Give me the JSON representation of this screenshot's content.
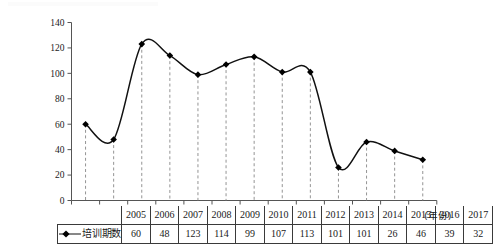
{
  "chart_data": {
    "type": "line",
    "title": "",
    "xlabel": "(年份)",
    "ylabel": "",
    "categories": [
      "2005",
      "2006",
      "2007",
      "2008",
      "2009",
      "2010",
      "2011",
      "2012",
      "2013",
      "2014",
      "2015",
      "2016",
      "2017"
    ],
    "series": [
      {
        "name": "培训期数",
        "values": [
          60,
          48,
          123,
          114,
          99,
          107,
          113,
          101,
          101,
          26,
          46,
          39,
          32
        ]
      }
    ],
    "ylim": [
      0,
      140
    ],
    "ytick_step": 20,
    "yticks": [
      "0",
      "20",
      "40",
      "60",
      "80",
      "100",
      "120",
      "140"
    ],
    "grid": false,
    "droplines": "dashed",
    "marker": "diamond",
    "line_style": "smooth-spline",
    "legend_position": "table-row-header",
    "colors": {
      "line": "#111111",
      "marker": "#000000",
      "axis": "#555555",
      "dropline": "#888888",
      "table_border": "#3a3a3a"
    }
  },
  "axis": {
    "y_ticks": [
      "140",
      "120",
      "100",
      "80",
      "60",
      "40",
      "20",
      "0"
    ],
    "x_unit_label": "(年份)"
  },
  "table": {
    "legend_label": "培训期数",
    "years": [
      "2005",
      "2006",
      "2007",
      "2008",
      "2009",
      "2010",
      "2011",
      "2012",
      "2013",
      "2014",
      "2015",
      "2016",
      "2017"
    ],
    "values": [
      "60",
      "48",
      "123",
      "114",
      "99",
      "107",
      "113",
      "101",
      "101",
      "26",
      "46",
      "39",
      "32"
    ]
  },
  "icons": {
    "legend_marker": "line-with-diamond-marker-icon"
  }
}
